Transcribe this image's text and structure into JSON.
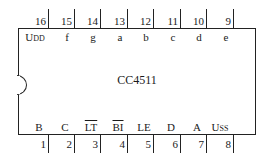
{
  "chip": {
    "name": "CC4511",
    "top_pins": [
      {
        "number": "16",
        "signal": "U",
        "sub": "DD"
      },
      {
        "number": "15",
        "signal": "f",
        "sub": ""
      },
      {
        "number": "14",
        "signal": "g",
        "sub": ""
      },
      {
        "number": "13",
        "signal": "a",
        "sub": ""
      },
      {
        "number": "12",
        "signal": "b",
        "sub": ""
      },
      {
        "number": "11",
        "signal": "c",
        "sub": ""
      },
      {
        "number": "10",
        "signal": "d",
        "sub": ""
      },
      {
        "number": "9",
        "signal": "e",
        "sub": ""
      }
    ],
    "bottom_pins": [
      {
        "number": "1",
        "signal": "B",
        "sub": "",
        "overline": false
      },
      {
        "number": "2",
        "signal": "C",
        "sub": "",
        "overline": false
      },
      {
        "number": "3",
        "signal": "LT",
        "sub": "",
        "overline": true
      },
      {
        "number": "4",
        "signal": "BI",
        "sub": "",
        "overline": true
      },
      {
        "number": "5",
        "signal": "LE",
        "sub": "",
        "overline": false
      },
      {
        "number": "6",
        "signal": "D",
        "sub": "",
        "overline": false
      },
      {
        "number": "7",
        "signal": "A",
        "sub": "",
        "overline": false
      },
      {
        "number": "8",
        "signal": "U",
        "sub": "SS",
        "overline": false
      }
    ]
  }
}
